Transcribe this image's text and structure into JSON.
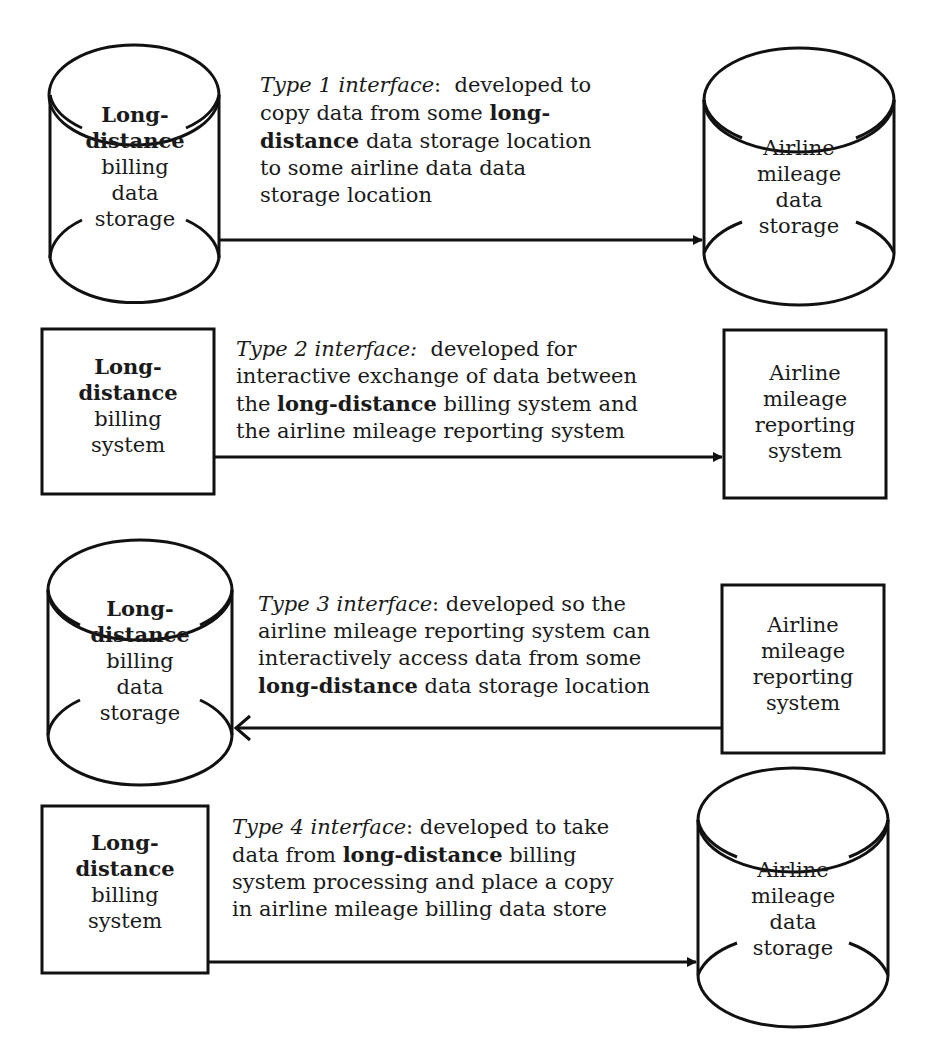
{
  "diagram": {
    "rows": [
      {
        "id": "type1",
        "source": {
          "shape": "cylinder",
          "lines_bold": [
            "Long-",
            "distance"
          ],
          "lines": [
            "billing",
            "data",
            "storage"
          ]
        },
        "target": {
          "shape": "cylinder",
          "lines": [
            "Airline",
            "mileage",
            "data",
            "storage"
          ]
        },
        "arrow_direction": "right",
        "description": {
          "title": "Type 1 interface",
          "parts": [
            ": developed to copy data from some ",
            "long-distance",
            " data storage location to some airline data data storage location"
          ],
          "lines": [
            "developed to",
            "copy data from some ",
            "long-",
            "distance",
            " data storage location",
            "to some airline data data",
            "storage location"
          ]
        }
      },
      {
        "id": "type2",
        "source": {
          "shape": "box",
          "lines_bold": [
            "Long-",
            "distance"
          ],
          "lines": [
            "billing",
            "system"
          ]
        },
        "target": {
          "shape": "box",
          "lines": [
            "Airline",
            "mileage",
            "reporting",
            "system"
          ]
        },
        "arrow_direction": "right",
        "description": {
          "title": "Type 2 interface:",
          "lines": [
            "developed for",
            "interactive exchange of data between",
            "the ",
            "long-distance",
            " billing system and",
            "the airline mileage reporting system"
          ]
        }
      },
      {
        "id": "type3",
        "source": {
          "shape": "cylinder",
          "lines_bold": [
            "Long-",
            "distance"
          ],
          "lines": [
            "billing",
            "data",
            "storage"
          ]
        },
        "target": {
          "shape": "box",
          "lines": [
            "Airline",
            "mileage",
            "reporting",
            "system"
          ]
        },
        "arrow_direction": "left",
        "description": {
          "title": "Type 3 interface",
          "lines": [
            ":  developed so the",
            "airline mileage reporting system can",
            "interactively access data from some",
            "long-distance",
            " data storage location"
          ]
        }
      },
      {
        "id": "type4",
        "source": {
          "shape": "box",
          "lines_bold": [
            "Long-",
            "distance"
          ],
          "lines": [
            "billing",
            "system"
          ]
        },
        "target": {
          "shape": "cylinder",
          "lines": [
            "Airline",
            "mileage",
            "data",
            "storage"
          ]
        },
        "arrow_direction": "right",
        "description": {
          "title": "Type 4 interface",
          "lines": [
            ":  developed to take",
            "data from ",
            "long-distance",
            " billing",
            "system processing and place a copy",
            "in airline mileage billing data store"
          ]
        }
      }
    ]
  }
}
